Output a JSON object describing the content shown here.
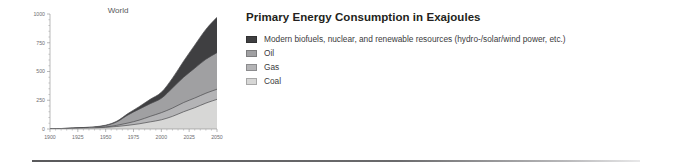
{
  "legend_panel": {
    "title": "Primary Energy Consumption in Exajoules",
    "items": [
      {
        "label": "Modern biofuels, nuclear, and renewable resources (hydro-/solar/wind power, etc.)",
        "color": "#3f3f41",
        "name": "renewables"
      },
      {
        "label": "Oil",
        "color": "#a0a0a2",
        "name": "oil"
      },
      {
        "label": "Gas",
        "color": "#b4b4b6",
        "name": "gas"
      },
      {
        "label": "Coal",
        "color": "#d7d7d6",
        "name": "coal"
      }
    ]
  },
  "chart_data": {
    "type": "area",
    "title": "World",
    "xlabel": "",
    "ylabel": "",
    "xlim": [
      1900,
      2050
    ],
    "ylim": [
      0,
      1000
    ],
    "grid": false,
    "legend_position": "right",
    "stacked": true,
    "xticks": [
      1900,
      1925,
      1950,
      1975,
      2000,
      2025,
      2050
    ],
    "yticks": [
      0,
      250,
      500,
      750,
      1000
    ],
    "x": [
      1900,
      1930,
      1940,
      1950,
      1960,
      1970,
      1980,
      1990,
      2000,
      2010,
      2020,
      2030,
      2040,
      2050
    ],
    "series": [
      {
        "name": "Coal",
        "color": "#d7d7d6",
        "values": [
          0,
          8,
          10,
          14,
          22,
          32,
          45,
          62,
          80,
          110,
          150,
          185,
          225,
          258
        ]
      },
      {
        "name": "Gas",
        "color": "#b4b4b6",
        "values": [
          0,
          1,
          2,
          4,
          10,
          20,
          32,
          48,
          62,
          72,
          80,
          84,
          86,
          88
        ]
      },
      {
        "name": "Oil",
        "color": "#a0a0a2",
        "values": [
          0,
          3,
          5,
          12,
          30,
          70,
          95,
          110,
          125,
          175,
          220,
          260,
          295,
          318
        ]
      },
      {
        "name": "Modern biofuels, nuclear, and renewable resources (hydro-/solar/wind power, etc.)",
        "color": "#3f3f41",
        "values": [
          0,
          1,
          2,
          3,
          6,
          12,
          22,
          38,
          52,
          85,
          140,
          200,
          260,
          308
        ]
      }
    ],
    "totals": [
      0,
      13,
      19,
      33,
      68,
      134,
      194,
      258,
      319,
      442,
      590,
      729,
      866,
      972
    ]
  }
}
